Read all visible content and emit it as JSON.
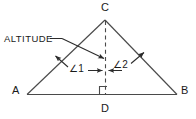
{
  "figure": {
    "type": "geometry-diagram",
    "background_color": "#ffffff",
    "stroke_color": "#3a3a3a",
    "text_color": "#1a1a1a",
    "vertices": {
      "a_label": "A",
      "b_label": "B",
      "c_label": "C",
      "d_label": "D"
    },
    "angles": {
      "angle1_label": "∠1",
      "angle2_label": "∠2"
    },
    "callout": {
      "altitude_label": "ALTITUDE"
    },
    "markers": {
      "right_angle_at_d": "right-angle-square",
      "altitude_line_style": "dashed"
    }
  }
}
